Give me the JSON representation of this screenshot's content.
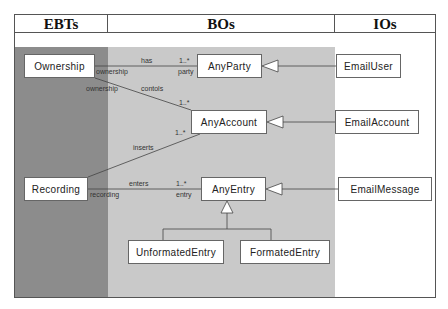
{
  "columns": {
    "ebts": {
      "title": "EBTs",
      "color": "#8c8c8c"
    },
    "bos": {
      "title": "BOs",
      "color": "#c9c9c9"
    },
    "ios": {
      "title": "IOs",
      "color": "#ffffff"
    }
  },
  "classes": {
    "ownership": "Ownership",
    "recording": "Recording",
    "any_party": "AnyParty",
    "any_account": "AnyAccount",
    "any_entry": "AnyEntry",
    "unformated_entry": "UnformatedEntry",
    "formated_entry": "FormatedEntry",
    "email_user": "EmailUser",
    "email_account": "EmailAccount",
    "email_message": "EmailMessage"
  },
  "associations": {
    "has": {
      "name": "has",
      "source_role": "ownership",
      "target_role": "party",
      "multiplicity": "1..*"
    },
    "controls": {
      "name": "contols",
      "source_role": "ownership",
      "multiplicity": "1..*"
    },
    "inserts": {
      "name": "inserts",
      "multiplicity": "1..*"
    },
    "enters": {
      "name": "enters",
      "source_role": "recording",
      "target_role": "entry",
      "multiplicity": "1..*"
    }
  }
}
